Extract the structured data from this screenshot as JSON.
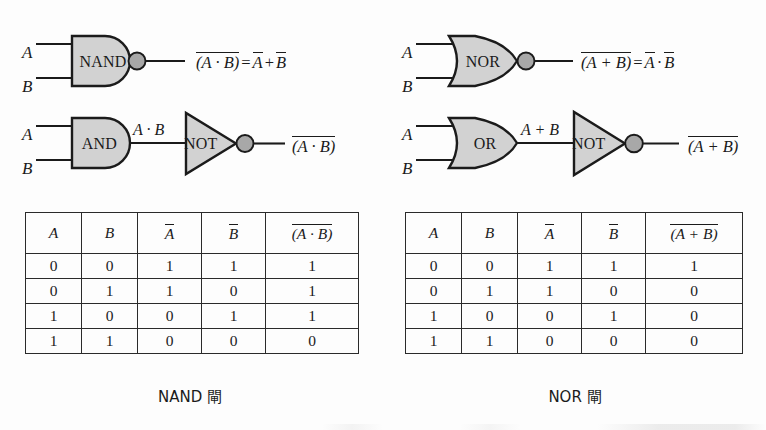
{
  "figure": {
    "background_color": "#fdfdfd",
    "ink_color": "#1b1b1b",
    "gate_fill_color": "#d2d2d2",
    "bubble_fill_color": "#a8a8a8"
  },
  "panels": [
    {
      "id": "nand",
      "caption": "NAND 閘",
      "row_single": {
        "gate_label": "NAND",
        "inputs": [
          "A",
          "B"
        ],
        "has_output_bubble": true,
        "expression": {
          "lhs_overbar": "(A · B)",
          "equals": "=",
          "rhs": "A̅ + B̅",
          "rhs_parts": [
            {
              "text": "A",
              "overbar": true
            },
            {
              "text": "+",
              "overbar": false
            },
            {
              "text": "B",
              "overbar": true
            }
          ]
        }
      },
      "row_equiv": {
        "gate1_label": "AND",
        "gate1_shape": "and",
        "gate2_label": "NOT",
        "gate2_shape": "not",
        "inputs": [
          "A",
          "B"
        ],
        "intermediate_signal": "A · B",
        "output_expression": "(A · B)",
        "output_has_overbar": true
      },
      "table": {
        "headers": [
          {
            "text": "A",
            "overbar": false,
            "italic": true
          },
          {
            "text": "B",
            "overbar": false,
            "italic": true
          },
          {
            "text": "A",
            "overbar": true,
            "italic": true
          },
          {
            "text": "B",
            "overbar": true,
            "italic": true
          },
          {
            "text": "(A · B)",
            "overbar": true,
            "italic": true
          }
        ],
        "rows": [
          [
            "0",
            "0",
            "1",
            "1",
            "1"
          ],
          [
            "0",
            "1",
            "1",
            "0",
            "1"
          ],
          [
            "1",
            "0",
            "0",
            "1",
            "1"
          ],
          [
            "1",
            "1",
            "0",
            "0",
            "0"
          ]
        ]
      }
    },
    {
      "id": "nor",
      "caption": "NOR 閘",
      "row_single": {
        "gate_label": "NOR",
        "inputs": [
          "A",
          "B"
        ],
        "has_output_bubble": true,
        "expression": {
          "lhs_overbar": "(A + B)",
          "equals": "=",
          "rhs": "A̅ · B̅",
          "rhs_parts": [
            {
              "text": "A",
              "overbar": true
            },
            {
              "text": "·",
              "overbar": false
            },
            {
              "text": "B",
              "overbar": true
            }
          ]
        }
      },
      "row_equiv": {
        "gate1_label": "OR",
        "gate1_shape": "or",
        "gate2_label": "NOT",
        "gate2_shape": "not",
        "inputs": [
          "A",
          "B"
        ],
        "intermediate_signal": "A + B",
        "output_expression": "(A + B)",
        "output_has_overbar": true
      },
      "table": {
        "headers": [
          {
            "text": "A",
            "overbar": false,
            "italic": true
          },
          {
            "text": "B",
            "overbar": false,
            "italic": true
          },
          {
            "text": "A",
            "overbar": true,
            "italic": true
          },
          {
            "text": "B",
            "overbar": true,
            "italic": true
          },
          {
            "text": "(A + B)",
            "overbar": true,
            "italic": true
          }
        ],
        "rows": [
          [
            "0",
            "0",
            "1",
            "1",
            "1"
          ],
          [
            "0",
            "1",
            "1",
            "0",
            "0"
          ],
          [
            "1",
            "0",
            "0",
            "1",
            "0"
          ],
          [
            "1",
            "1",
            "0",
            "0",
            "0"
          ]
        ]
      }
    }
  ]
}
